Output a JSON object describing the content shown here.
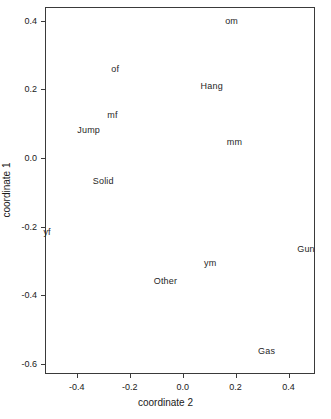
{
  "chart_data": {
    "type": "scatter",
    "title": "",
    "subtitle": "",
    "xlabel": "coordinate 2",
    "ylabel": "coordinate 1",
    "xlim": [
      -0.52,
      0.5
    ],
    "ylim": [
      -0.63,
      0.44
    ],
    "grid": false,
    "legend": null,
    "marker_style": "text-label-only",
    "xticks": [
      -0.4,
      -0.2,
      0.0,
      0.2,
      0.4
    ],
    "xticklabels": [
      "-0.4",
      "-0.2",
      "0.0",
      "0.2",
      "0.4"
    ],
    "yticks": [
      0.4,
      0.2,
      0.0,
      -0.2,
      -0.4,
      -0.6
    ],
    "yticklabels": [
      "0.4",
      "0.2",
      "0.0",
      "-0.2",
      "-0.4",
      "-0.6"
    ],
    "points": [
      {
        "label": "om",
        "x": 0.185,
        "y": 0.4
      },
      {
        "label": "of",
        "x": -0.255,
        "y": 0.26
      },
      {
        "label": "Hang",
        "x": 0.11,
        "y": 0.21
      },
      {
        "label": "mf",
        "x": -0.265,
        "y": 0.125
      },
      {
        "label": "Jump",
        "x": -0.355,
        "y": 0.082
      },
      {
        "label": "mm",
        "x": 0.196,
        "y": 0.046
      },
      {
        "label": "Solid",
        "x": -0.3,
        "y": -0.068
      },
      {
        "label": "yf",
        "x": -0.512,
        "y": -0.215
      },
      {
        "label": "Gun",
        "x": 0.466,
        "y": -0.267
      },
      {
        "label": "ym",
        "x": 0.104,
        "y": -0.306
      },
      {
        "label": "Other",
        "x": -0.065,
        "y": -0.36
      },
      {
        "label": "Gas",
        "x": 0.317,
        "y": -0.562
      }
    ]
  },
  "style": {
    "axis_color": "#3a3a3a",
    "text_color": "#1a1a1a",
    "label_color": "#262626",
    "background": "#ffffff"
  }
}
